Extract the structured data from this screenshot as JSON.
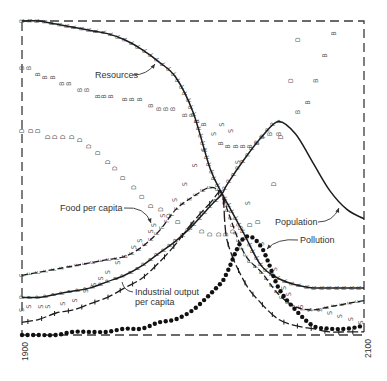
{
  "chart_data": {
    "type": "line",
    "title": "",
    "xlabel": "",
    "ylabel": "",
    "x_range": [
      1900,
      2100
    ],
    "ylim": [
      0,
      1
    ],
    "y_scale": "relative (no y-axis tick labels shown)",
    "grid": false,
    "legend": "none (curves labelled directly)",
    "x_tick_labels": [
      "1900",
      "2100"
    ],
    "x": [
      1900,
      1910,
      1920,
      1930,
      1940,
      1950,
      1960,
      1970,
      1980,
      1990,
      2000,
      2010,
      2017,
      2020,
      2030,
      2040,
      2050,
      2060,
      2070,
      2080,
      2090,
      2100
    ],
    "series": [
      {
        "name": "Resources",
        "style": "solid",
        "marker_letter": "R",
        "letter_spacing": 7.5,
        "values": [
          1.0,
          1.0,
          0.99,
          0.98,
          0.97,
          0.96,
          0.94,
          0.91,
          0.87,
          0.82,
          0.71,
          0.53,
          0.45,
          0.42,
          0.32,
          0.22,
          0.18,
          0.16,
          0.15,
          0.15,
          0.15,
          0.15
        ]
      },
      {
        "name": "Population",
        "style": "solid",
        "marker_letter": "P",
        "letter_spacing": 8,
        "letter_until": 2055,
        "values": [
          0.12,
          0.12,
          0.13,
          0.14,
          0.15,
          0.17,
          0.19,
          0.22,
          0.26,
          0.3,
          0.35,
          0.41,
          0.45,
          0.48,
          0.56,
          0.63,
          0.68,
          0.64,
          0.55,
          0.46,
          0.4,
          0.37
        ]
      },
      {
        "name": "Food per capita",
        "style": "dashed",
        "marker_letter": "F",
        "letter_spacing": 8,
        "values": [
          0.19,
          0.2,
          0.21,
          0.22,
          0.23,
          0.24,
          0.25,
          0.28,
          0.33,
          0.4,
          0.44,
          0.47,
          0.45,
          0.4,
          0.26,
          0.2,
          0.13,
          0.09,
          0.08,
          0.09,
          0.1,
          0.11
        ]
      },
      {
        "name": "Industrial output per capita",
        "style": "ticked",
        "values": [
          0.04,
          0.05,
          0.07,
          0.08,
          0.1,
          0.12,
          0.15,
          0.18,
          0.23,
          0.29,
          0.36,
          0.42,
          0.45,
          0.3,
          0.17,
          0.1,
          0.05,
          0.03,
          0.02,
          0.01,
          0.01,
          0.01
        ]
      },
      {
        "name": "Pollution",
        "style": "dotted",
        "values": [
          0.0,
          0.0,
          0.0,
          0.01,
          0.01,
          0.01,
          0.02,
          0.02,
          0.04,
          0.05,
          0.08,
          0.13,
          0.17,
          0.2,
          0.31,
          0.28,
          0.15,
          0.08,
          0.03,
          0.02,
          0.02,
          0.03
        ]
      }
    ],
    "printout_markers": [
      {
        "letter": "B",
        "points": [
          [
            1900,
            0.85
          ],
          [
            1904,
            0.85
          ],
          [
            1909,
            0.83
          ],
          [
            1913,
            0.82
          ],
          [
            1918,
            0.82
          ],
          [
            1923,
            0.8
          ],
          [
            1927,
            0.8
          ],
          [
            1934,
            0.78
          ],
          [
            1938,
            0.78
          ],
          [
            1944,
            0.76
          ],
          [
            1948,
            0.76
          ],
          [
            1952,
            0.76
          ],
          [
            1960,
            0.75
          ],
          [
            1964,
            0.75
          ],
          [
            1969,
            0.75
          ],
          [
            1975,
            0.73
          ],
          [
            1980,
            0.72
          ],
          [
            1984,
            0.72
          ],
          [
            1988,
            0.72
          ],
          [
            1995,
            0.7
          ],
          [
            1999,
            0.7
          ],
          [
            2002,
            0.68
          ],
          [
            2006,
            0.67
          ],
          [
            2016,
            0.61
          ],
          [
            2020,
            0.6
          ],
          [
            2025,
            0.6
          ],
          [
            2029,
            0.6
          ],
          [
            2033,
            0.6
          ],
          [
            2037,
            0.61
          ],
          [
            2040,
            0.63
          ],
          [
            2045,
            0.64
          ],
          [
            2050,
            0.64
          ],
          [
            2061,
            0.71
          ],
          [
            2067,
            0.74
          ],
          [
            2072,
            0.81
          ],
          [
            2077,
            0.89
          ],
          [
            2082,
            0.96
          ]
        ]
      },
      {
        "letter": "D",
        "points": [
          [
            1900,
            0.65
          ],
          [
            1905,
            0.65
          ],
          [
            1909,
            0.65
          ],
          [
            1915,
            0.63
          ],
          [
            1919,
            0.63
          ],
          [
            1924,
            0.63
          ],
          [
            1929,
            0.63
          ],
          [
            1934,
            0.62
          ],
          [
            1939,
            0.6
          ],
          [
            1944,
            0.58
          ],
          [
            1950,
            0.55
          ],
          [
            1954,
            0.53
          ],
          [
            1959,
            0.5
          ],
          [
            1965,
            0.47
          ],
          [
            1970,
            0.44
          ],
          [
            1975,
            0.41
          ],
          [
            1981,
            0.4
          ],
          [
            1986,
            0.38
          ],
          [
            1991,
            0.36
          ],
          [
            1998,
            0.34
          ],
          [
            2005,
            0.33
          ],
          [
            2010,
            0.32
          ],
          [
            2015,
            0.32
          ],
          [
            2019,
            0.32
          ],
          [
            2023,
            0.33
          ],
          [
            2028,
            0.34
          ],
          [
            2033,
            0.35
          ],
          [
            2038,
            0.36
          ],
          [
            2047,
            0.48
          ],
          [
            2051,
            0.63
          ],
          [
            2057,
            0.81
          ],
          [
            2061,
            0.94
          ]
        ]
      },
      {
        "letter": "S",
        "points": [
          [
            1900,
            0.08
          ],
          [
            1904,
            0.09
          ],
          [
            1911,
            0.09
          ],
          [
            1915,
            0.09
          ],
          [
            1924,
            0.1
          ],
          [
            1931,
            0.11
          ],
          [
            1937,
            0.14
          ],
          [
            1942,
            0.16
          ],
          [
            1946,
            0.18
          ],
          [
            1950,
            0.2
          ],
          [
            1956,
            0.23
          ],
          [
            1960,
            0.25
          ],
          [
            1965,
            0.28
          ],
          [
            1969,
            0.3
          ],
          [
            1975,
            0.33
          ],
          [
            1977,
            0.35
          ],
          [
            1982,
            0.38
          ],
          [
            1989,
            0.43
          ],
          [
            1995,
            0.48
          ],
          [
            2001,
            0.54
          ],
          [
            2006,
            0.59
          ],
          [
            2012,
            0.64
          ],
          [
            2017,
            0.67
          ],
          [
            2022,
            0.65
          ],
          [
            2026,
            0.55
          ],
          [
            2032,
            0.42
          ],
          [
            2040,
            0.29
          ],
          [
            2048,
            0.21
          ],
          [
            2053,
            0.15
          ],
          [
            2056,
            0.13
          ],
          [
            2063,
            0.09
          ],
          [
            2068,
            0.08
          ],
          [
            2074,
            0.08
          ],
          [
            2080,
            0.07
          ],
          [
            2086,
            0.06
          ],
          [
            2092,
            0.05
          ],
          [
            2098,
            0.04
          ]
        ]
      }
    ],
    "annotations": [
      {
        "text": "Resources"
      },
      {
        "text": "Food per capita"
      },
      {
        "lines": [
          "Industrial output",
          "per capita"
        ]
      },
      {
        "text": "Population"
      },
      {
        "text": "Pollution"
      }
    ]
  }
}
